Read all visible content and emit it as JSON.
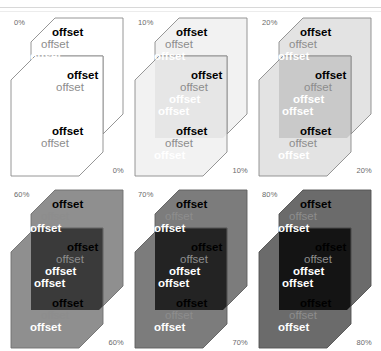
{
  "figure": {
    "word": "offset",
    "rows": 2,
    "columns": 3,
    "background": "#ffffff"
  },
  "legend": {
    "text_variants": [
      {
        "name": "black",
        "color": "#000000",
        "weight": "bold"
      },
      {
        "name": "gray",
        "color": "#8d8d8d",
        "weight": "normal"
      },
      {
        "name": "white",
        "color": "#ffffff",
        "weight": "bold"
      }
    ]
  },
  "panels": [
    {
      "id": "panel-0",
      "opacity_label": "0%",
      "opacity_value": 0,
      "label_top_left": "0%",
      "label_bottom_right": "0%",
      "fill": "#ffffff",
      "fill_overlap": "#ffffff",
      "stroke": "#8a8a8a",
      "regions": [
        {
          "name": "top",
          "labels": [
            "offset",
            "offset",
            "offset"
          ]
        },
        {
          "name": "middle",
          "labels": [
            "offset",
            "offset",
            "offset"
          ]
        },
        {
          "name": "bottom",
          "labels": [
            "offset",
            "offset",
            "offset"
          ]
        }
      ]
    },
    {
      "id": "panel-10",
      "opacity_label": "10%",
      "opacity_value": 10,
      "label_top_left": "10%",
      "label_bottom_right": "10%",
      "fill": "#f2f2f2",
      "fill_overlap": "#e6e6e6",
      "stroke": "#8a8a8a",
      "regions": [
        {
          "name": "top",
          "labels": [
            "offset",
            "offset",
            "offset"
          ]
        },
        {
          "name": "middle",
          "labels": [
            "offset",
            "offset",
            "offset"
          ]
        },
        {
          "name": "bottom",
          "labels": [
            "offset",
            "offset",
            "offset"
          ]
        }
      ]
    },
    {
      "id": "panel-20",
      "opacity_label": "20%",
      "opacity_value": 20,
      "label_top_left": "20%",
      "label_bottom_right": "20%",
      "fill": "#e3e3e3",
      "fill_overlap": "#c9c9c9",
      "stroke": "#8a8a8a",
      "regions": [
        {
          "name": "top",
          "labels": [
            "offset",
            "offset",
            "offset"
          ]
        },
        {
          "name": "middle",
          "labels": [
            "offset",
            "offset",
            "offset"
          ]
        },
        {
          "name": "bottom",
          "labels": [
            "offset",
            "offset",
            "offset"
          ]
        }
      ]
    },
    {
      "id": "panel-60",
      "opacity_label": "60%",
      "opacity_value": 60,
      "label_top_left": "60%",
      "label_bottom_right": "60%",
      "fill": "#8f8f8f",
      "fill_overlap": "#3a3a3a",
      "stroke": "#6f6f6f",
      "regions": [
        {
          "name": "top",
          "labels": [
            "offset",
            "offset",
            "offset"
          ]
        },
        {
          "name": "middle",
          "labels": [
            "offset",
            "offset",
            "offset"
          ]
        },
        {
          "name": "bottom",
          "labels": [
            "offset",
            "offset",
            "offset"
          ]
        }
      ]
    },
    {
      "id": "panel-70",
      "opacity_label": "70%",
      "opacity_value": 70,
      "label_top_left": "70%",
      "label_bottom_right": "70%",
      "fill": "#7c7c7c",
      "fill_overlap": "#232323",
      "stroke": "#5f5f5f",
      "regions": [
        {
          "name": "top",
          "labels": [
            "offset",
            "offset",
            "offset"
          ]
        },
        {
          "name": "middle",
          "labels": [
            "offset",
            "offset",
            "offset"
          ]
        },
        {
          "name": "bottom",
          "labels": [
            "offset",
            "offset",
            "offset"
          ]
        }
      ]
    },
    {
      "id": "panel-80",
      "opacity_label": "80%",
      "opacity_value": 80,
      "label_top_left": "80%",
      "label_bottom_right": "80%",
      "fill": "#6b6b6b",
      "fill_overlap": "#141414",
      "stroke": "#525252",
      "regions": [
        {
          "name": "top",
          "labels": [
            "offset",
            "offset",
            "offset"
          ]
        },
        {
          "name": "middle",
          "labels": [
            "offset",
            "offset",
            "offset"
          ]
        },
        {
          "name": "bottom",
          "labels": [
            "offset",
            "offset",
            "offset"
          ]
        }
      ]
    }
  ]
}
